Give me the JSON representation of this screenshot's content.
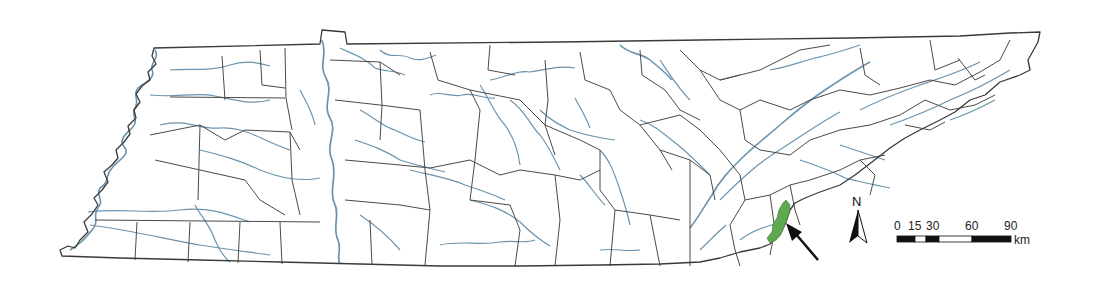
{
  "map": {
    "subject": "Tennessee counties with rivers",
    "colors": {
      "background": "#ffffff",
      "county_border": "#4a4a4a",
      "state_border": "#3a3a3a",
      "river": "#5b89a6",
      "highlight": "#5fa84f",
      "arrow": "#111111"
    },
    "highlighted_area": {
      "label": "study area",
      "location": "southeastern border"
    }
  },
  "north_arrow": {
    "label": "N"
  },
  "scale_bar": {
    "labels": [
      "0",
      "15",
      "30",
      "60",
      "90"
    ],
    "unit": "km",
    "segments": [
      {
        "from": 0,
        "to": 15,
        "fill": "black"
      },
      {
        "from": 15,
        "to": 30,
        "fill": "white"
      },
      {
        "from": 30,
        "to": 45,
        "fill": "black"
      },
      {
        "from": 45,
        "to": 60,
        "fill": "white"
      },
      {
        "from": 60,
        "to": 90,
        "fill": "black"
      }
    ]
  }
}
